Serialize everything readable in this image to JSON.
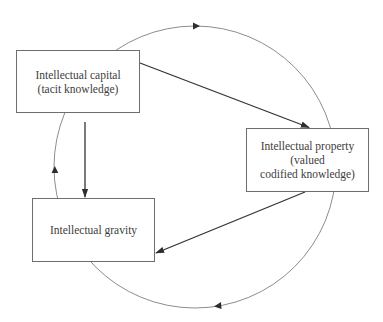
{
  "diagram": {
    "nodes": [
      {
        "id": "capital",
        "lines": [
          "Intellectual capital",
          "(tacit knowledge)"
        ],
        "text": "Intellectual capital\n(tacit knowledge)"
      },
      {
        "id": "property",
        "lines": [
          "Intellectual property",
          "(valued",
          "codified knowledge)"
        ],
        "text": "Intellectual property\n(valued\ncodified knowledge)"
      },
      {
        "id": "gravity",
        "lines": [
          "Intellectual gravity"
        ],
        "text": "Intellectual gravity"
      }
    ],
    "edges": [
      {
        "from": "capital",
        "to": "property",
        "style": "straight-arrow"
      },
      {
        "from": "property",
        "to": "gravity",
        "style": "straight-arrow"
      },
      {
        "from": "capital",
        "to": "gravity",
        "style": "straight-arrow"
      }
    ],
    "cycle": {
      "shape": "circle",
      "direction": "clockwise",
      "arrowheads": [
        "top",
        "bottom",
        "left"
      ]
    },
    "colors": {
      "box_border": "#6e6e6e",
      "arrow": "#333333",
      "cycle_line": "#7a7a7a",
      "text": "#3d3d3d"
    }
  }
}
